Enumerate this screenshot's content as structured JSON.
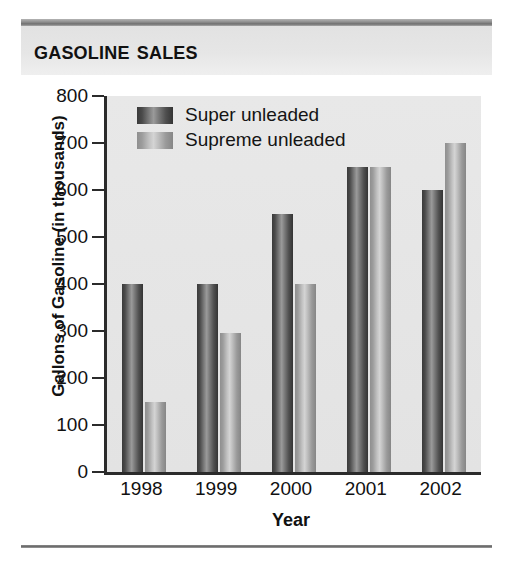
{
  "header": {
    "title": "Gasoline Sales"
  },
  "chart_data": {
    "type": "bar",
    "title": "Gasoline Sales",
    "xlabel": "Year",
    "ylabel": "Gallons of Gasoline (in thousands)",
    "categories": [
      "1998",
      "1999",
      "2000",
      "2001",
      "2002"
    ],
    "series": [
      {
        "name": "Super unleaded",
        "color": "#5a5a5a",
        "values": [
          400,
          400,
          550,
          650,
          600
        ]
      },
      {
        "name": "Supreme unleaded",
        "color": "#b5b5b5",
        "values": [
          150,
          295,
          400,
          650,
          700
        ]
      }
    ],
    "ylim": [
      0,
      800
    ],
    "yticks": [
      0,
      100,
      200,
      300,
      400,
      500,
      600,
      700,
      800
    ],
    "ytick_labels": [
      "0",
      "100",
      "200",
      "300",
      "400",
      "500",
      "600",
      "700",
      "800"
    ],
    "grid": false,
    "legend_position": "top-left inside plot area",
    "plot_background": "#e5e5e5",
    "axis_color": "#2b2b2b"
  }
}
